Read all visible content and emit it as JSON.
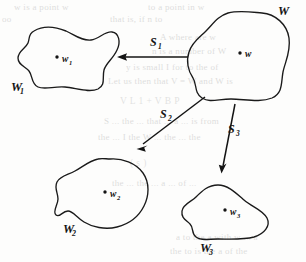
{
  "figure": {
    "background_color": "#fdfdfc",
    "ink_color": "#141414",
    "sets": [
      {
        "id": "w",
        "label": "W",
        "subscript": "",
        "point_label": "w",
        "point_subscript": "",
        "label_x": 278,
        "label_y": 15,
        "point_x": 240,
        "point_y": 53,
        "point_label_x": 245,
        "point_label_y": 57,
        "point_label_sub_x": 252,
        "point_label_sub_y": 60
      },
      {
        "id": "w1",
        "label": "W",
        "subscript": "1",
        "point_label": "w",
        "point_subscript": "1",
        "label_x": 11,
        "label_y": 91,
        "label_sub_x": 20,
        "label_sub_y": 94,
        "point_x": 57,
        "point_y": 57,
        "point_label_x": 62,
        "point_label_y": 62,
        "point_label_sub_x": 69,
        "point_label_sub_y": 65
      },
      {
        "id": "w2",
        "label": "W",
        "subscript": "2",
        "point_label": "w",
        "point_subscript": "2",
        "label_x": 63,
        "label_y": 233,
        "label_sub_x": 72,
        "label_sub_y": 236,
        "point_x": 105,
        "point_y": 192,
        "point_label_x": 110,
        "point_label_y": 197,
        "point_label_sub_x": 117,
        "point_label_sub_y": 200
      },
      {
        "id": "w3",
        "label": "W",
        "subscript": "3",
        "point_label": "w",
        "point_subscript": "3",
        "label_x": 200,
        "label_y": 252,
        "label_sub_x": 209,
        "label_sub_y": 255,
        "point_x": 225,
        "point_y": 210,
        "point_label_x": 230,
        "point_label_y": 215,
        "point_label_sub_x": 237,
        "point_label_sub_y": 218
      }
    ],
    "maps": [
      {
        "id": "s1",
        "label": "S",
        "subscript": "1",
        "label_x": 150,
        "label_y": 46,
        "label_sub_x": 158,
        "label_sub_y": 49,
        "from": "w",
        "to": "w1",
        "direction": "left"
      },
      {
        "id": "s2",
        "label": "S",
        "subscript": "2",
        "label_x": 160,
        "label_y": 118,
        "label_sub_x": 168,
        "label_sub_y": 121,
        "from": "w",
        "to": "w2",
        "direction": "down-left"
      },
      {
        "id": "s3",
        "label": "S",
        "subscript": "3",
        "label_x": 228,
        "label_y": 133,
        "label_sub_x": 236,
        "label_sub_y": 136,
        "from": "w",
        "to": "w3",
        "direction": "down"
      }
    ],
    "ghost_lines": [
      {
        "text": "w  is a point  w",
        "x": 14,
        "y": 10
      },
      {
        "text": "to a point  in  w",
        "x": 148,
        "y": 10
      },
      {
        "text": "oo",
        "x": 2,
        "y": 22
      },
      {
        "text": "that is, if  n  to",
        "x": 110,
        "y": 22
      },
      {
        "text": "A where are w",
        "x": 160,
        "y": 40
      },
      {
        "text": "n  is  a  number  of  W",
        "x": 152,
        "y": 54
      },
      {
        "text": "y  is  small  I  for  to the  of",
        "x": 126,
        "y": 70
      },
      {
        "text": "Let  us  then  that  V  =  W  and  W  is",
        "x": 108,
        "y": 84
      },
      {
        "text": "V    L    1    +    V    B    P",
        "x": 120,
        "y": 104
      },
      {
        "text": "S  ... the  ... that  ... a  ... is  from",
        "x": 104,
        "y": 124
      },
      {
        "text": "the  ... I  the  W  ...  the  ...  the",
        "x": 98,
        "y": 140
      },
      {
        "text": "(      s      )",
        "x": 130,
        "y": 166
      },
      {
        "text": "the    ...  the  ...  a  ...  of  ...",
        "x": 112,
        "y": 186
      },
      {
        "text": "a  to  the  a  with  w  ...  a",
        "x": 176,
        "y": 240
      },
      {
        "text": "the  to  is  the  a  of  the",
        "x": 170,
        "y": 254
      }
    ]
  }
}
